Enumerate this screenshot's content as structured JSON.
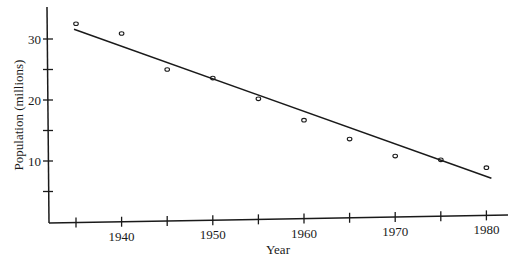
{
  "chart_data": {
    "type": "scatter",
    "title": "",
    "xlabel": "Year",
    "ylabel": "Population (millions)",
    "x": [
      1935,
      1940,
      1945,
      1950,
      1955,
      1960,
      1965,
      1970,
      1975,
      1980
    ],
    "series": [
      {
        "name": "Observed population",
        "marker": "open-circle",
        "values": [
          32.5,
          30.9,
          25.0,
          23.6,
          20.2,
          16.7,
          13.6,
          10.8,
          10.2,
          8.9
        ]
      },
      {
        "name": "Linear fit",
        "style": "line",
        "points": [
          [
            1935,
            31.6
          ],
          [
            1980,
            7.1
          ]
        ]
      }
    ],
    "xlim": [
      1931,
      1983
    ],
    "ylim": [
      0,
      35
    ],
    "x_ticks": [
      1935,
      1940,
      1945,
      1950,
      1955,
      1960,
      1965,
      1970,
      1975,
      1980
    ],
    "x_tick_labels": [
      "1940",
      "1950",
      "1960",
      "1970",
      "1980"
    ],
    "y_ticks": [
      5,
      10,
      15,
      20,
      25,
      30
    ],
    "y_tick_labels": [
      "10",
      "20",
      "30"
    ],
    "grid": false,
    "legend": null
  },
  "axes": {
    "x_label": "Year",
    "y_label": "Population (millions)"
  }
}
